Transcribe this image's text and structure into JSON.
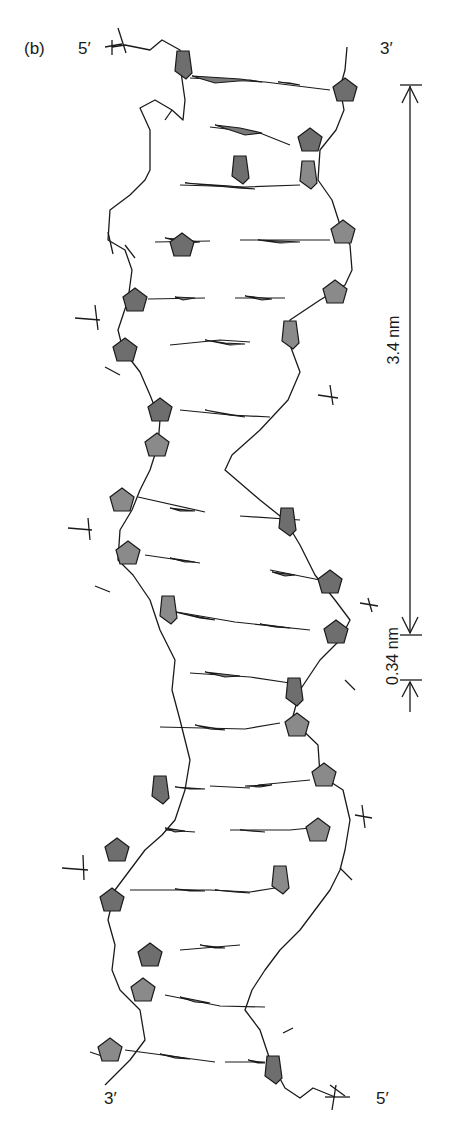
{
  "figure": {
    "panel_label": "(b)",
    "strand_ends": {
      "top_left": "5′",
      "top_right": "3′",
      "bottom_left": "3′",
      "bottom_right": "5′"
    },
    "dimensions": {
      "helical_turn": "3.4 nm",
      "base_pair_rise": "0.34 nm"
    },
    "colors": {
      "sugar_fill_dark": "#6e6e6e",
      "sugar_fill_light": "#8a8a8a",
      "line": "#1a1a1a",
      "background": "#ffffff"
    }
  }
}
